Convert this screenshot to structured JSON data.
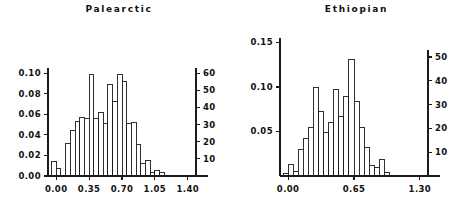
{
  "figure": {
    "width": 475,
    "height": 208,
    "background": "#ffffff",
    "ink_color": "#1a1a1a"
  },
  "panels": [
    {
      "id": "palearctic",
      "title": "Palearctic",
      "left_axis_ticks": [
        "0.00",
        "0.02",
        "0.04",
        "0.06",
        "0.08",
        "0.10"
      ],
      "right_axis_ticks": [
        "10",
        "20",
        "30",
        "40",
        "50",
        "60"
      ],
      "x_axis_ticks": [
        "0.00",
        "0.35",
        "0.70",
        "1.05",
        "1.40"
      ]
    },
    {
      "id": "ethiopian",
      "title": "Ethiopian",
      "left_axis_ticks": [
        "0.05",
        "0.10",
        "0.15"
      ],
      "right_axis_ticks": [
        "10",
        "20",
        "30",
        "40",
        "50"
      ],
      "x_axis_ticks": [
        "0.00",
        "0.65",
        "1.30"
      ]
    }
  ],
  "chart_data": [
    {
      "type": "bar",
      "id": "palearctic",
      "title": "Palearctic",
      "xlabel": "",
      "ylabel": "",
      "grid": false,
      "legend": null,
      "xlim": [
        -0.0875,
        1.4875
      ],
      "ylim": [
        0.0,
        0.105
      ],
      "y2lim": [
        0,
        63
      ],
      "xticks": [
        0.0,
        0.35,
        0.7,
        1.05,
        1.4
      ],
      "xticklabels": [
        "0.00",
        "0.35",
        "0.70",
        "1.05",
        "1.40"
      ],
      "yticks": [
        0.0,
        0.02,
        0.04,
        0.06,
        0.08,
        0.1
      ],
      "yticklabels": [
        "0.00",
        "0.02",
        "0.04",
        "0.06",
        "0.08",
        "0.10"
      ],
      "y2ticks": [
        10,
        20,
        30,
        40,
        50,
        60
      ],
      "y2ticklabels": [
        "10",
        "20",
        "30",
        "40",
        "50",
        "60"
      ],
      "bin_width": 0.05,
      "bin_starts": [
        -0.05,
        0.0,
        0.05,
        0.1,
        0.15,
        0.2,
        0.25,
        0.3,
        0.35,
        0.4,
        0.45,
        0.5,
        0.55,
        0.6,
        0.65,
        0.7,
        0.75,
        0.8,
        0.85,
        0.9,
        0.95,
        1.0,
        1.05,
        1.1
      ],
      "values": [
        0.014,
        0.007,
        0.0,
        0.032,
        0.044,
        0.053,
        0.057,
        0.056,
        0.099,
        0.056,
        0.062,
        0.051,
        0.089,
        0.072,
        0.099,
        0.092,
        0.051,
        0.052,
        0.031,
        0.012,
        0.015,
        0.003,
        0.005,
        0.003
      ],
      "counts": [
        8,
        4,
        0,
        19,
        26,
        32,
        34,
        33,
        59,
        33,
        37,
        30,
        53,
        43,
        59,
        55,
        30,
        31,
        18,
        7,
        9,
        2,
        3,
        2
      ]
    },
    {
      "type": "bar",
      "id": "ethiopian",
      "title": "Ethiopian",
      "xlabel": "",
      "ylabel": "",
      "grid": false,
      "legend": null,
      "xlim": [
        -0.08,
        1.38
      ],
      "ylim": [
        0.0,
        0.155
      ],
      "y2lim": [
        0,
        58
      ],
      "xticks": [
        0.0,
        0.65,
        1.3
      ],
      "xticklabels": [
        "0.00",
        "0.65",
        "1.30"
      ],
      "yticks": [
        0.05,
        0.1,
        0.15
      ],
      "yticklabels": [
        "0.05",
        "0.10",
        "0.15"
      ],
      "y2ticks": [
        10,
        20,
        30,
        40,
        50
      ],
      "y2ticklabels": [
        "10",
        "20",
        "30",
        "40",
        "50"
      ],
      "bin_width": 0.05,
      "bin_starts": [
        -0.05,
        0.0,
        0.05,
        0.1,
        0.15,
        0.2,
        0.25,
        0.3,
        0.35,
        0.4,
        0.45,
        0.5,
        0.55,
        0.6,
        0.65,
        0.7,
        0.75,
        0.8,
        0.85,
        0.9,
        0.95,
        1.0
      ],
      "values": [
        0.003,
        0.013,
        0.005,
        0.03,
        0.042,
        0.054,
        0.099,
        0.073,
        0.049,
        0.06,
        0.097,
        0.067,
        0.089,
        0.131,
        0.084,
        0.055,
        0.032,
        0.012,
        0.009,
        0.019,
        0.004,
        0.0
      ],
      "counts": [
        1,
        5,
        2,
        11,
        16,
        20,
        37,
        27,
        18,
        22,
        36,
        25,
        33,
        49,
        31,
        20,
        12,
        4,
        3,
        7,
        1,
        0
      ]
    }
  ]
}
